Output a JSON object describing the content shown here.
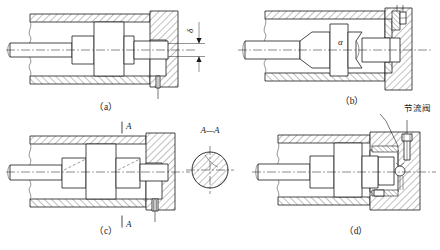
{
  "figure": {
    "background_color": "#ffffff",
    "line_color": "#1a1a1a",
    "panel_count": 4
  },
  "panels": [
    {
      "id": "a",
      "caption": "（a）",
      "description": "Constant-clearance (annular gap) cushion with plain cylindrical cushion plunger and fixed throttling gap",
      "annotations": [
        {
          "name": "gap-dimension",
          "label": "δ",
          "kind": "dimension-symbol"
        }
      ]
    },
    {
      "id": "b",
      "caption": "（b）",
      "description": "Tapered (conical) cushion plunger giving variable throttling area",
      "annotations": [
        {
          "name": "cone-angle",
          "label": "α",
          "kind": "angle-symbol"
        }
      ]
    },
    {
      "id": "c",
      "caption": "（c）",
      "description": "Cushion plunger with axial throttling groove, shown with section cut A—A",
      "annotations": [
        {
          "name": "section-mark-top",
          "label": "A",
          "kind": "section-letter"
        },
        {
          "name": "section-mark-bottom",
          "label": "A",
          "kind": "section-letter"
        }
      ]
    },
    {
      "id": "d",
      "caption": "（d）",
      "description": "Adjustable cushion with throttle valve and check valve in the end cap",
      "annotations": [
        {
          "name": "throttle-valve-callout",
          "label": "节流阀",
          "kind": "leader-callout"
        }
      ]
    }
  ],
  "section_view": {
    "name": "section-a-a",
    "label": "A—A",
    "description": "Circular cross-section of the cushion plunger showing the axial throttling groove"
  },
  "icons": {
    "arrow_up": "arrow-up-icon",
    "arrow_down": "arrow-down-icon",
    "leader_line": "leader-line-icon"
  }
}
